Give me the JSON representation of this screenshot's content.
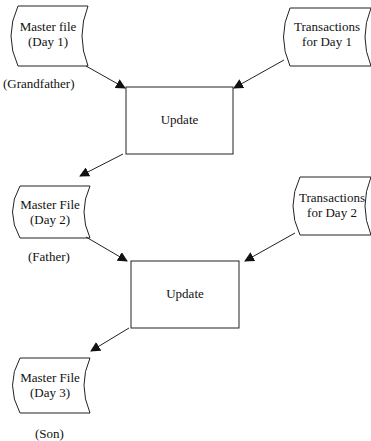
{
  "diagram": {
    "type": "grandfather-father-son backup flow",
    "nodes": {
      "master_day1": {
        "line1": "Master file",
        "line2": "(Day 1)",
        "shape": "stored-data"
      },
      "trans_day1": {
        "line1": "Transactions",
        "line2": "for Day 1",
        "shape": "stored-data"
      },
      "update1": {
        "label": "Update",
        "shape": "process"
      },
      "master_day2": {
        "line1": "Master File",
        "line2": "(Day 2)",
        "shape": "stored-data"
      },
      "trans_day2": {
        "line1": "Transactions",
        "line2": "for Day 2",
        "shape": "stored-data"
      },
      "update2": {
        "label": "Update",
        "shape": "process"
      },
      "master_day3": {
        "line1": "Master File",
        "line2": "(Day 3)",
        "shape": "stored-data"
      }
    },
    "generations": {
      "grandfather": "(Grandfather)",
      "father": "(Father)",
      "son": "(Son)"
    },
    "edges": [
      {
        "from": "master_day1",
        "to": "update1"
      },
      {
        "from": "trans_day1",
        "to": "update1"
      },
      {
        "from": "update1",
        "to": "master_day2"
      },
      {
        "from": "master_day2",
        "to": "update2"
      },
      {
        "from": "trans_day2",
        "to": "update2"
      },
      {
        "from": "update2",
        "to": "master_day3"
      }
    ],
    "colors": {
      "stroke": "#222222",
      "background": "#ffffff"
    }
  }
}
